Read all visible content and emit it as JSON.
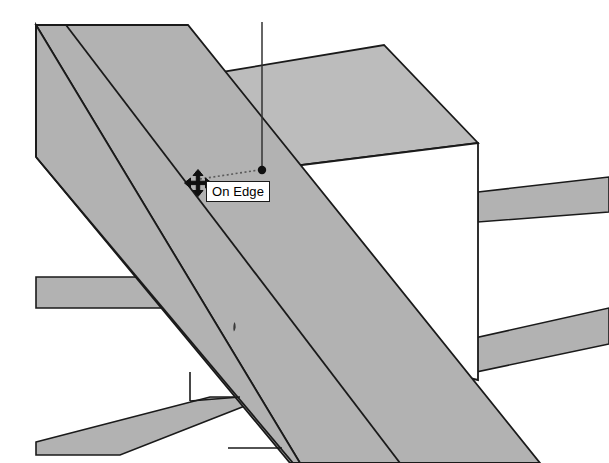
{
  "app": {
    "name": "SketchUp",
    "view_mode": "3D Perspective Viewport",
    "background_color": "#ffffff"
  },
  "viewport": {
    "width": 609,
    "height": 463,
    "face_fill": "#b2b2b2",
    "top_face_fill": "#bcbcbc",
    "edge_color": "#1a1a1a",
    "axis_line_color": "#333333",
    "white_face_fill": "#ffffff"
  },
  "tooltip": {
    "label": "On Edge",
    "inference_type": "edge",
    "background": "#ffffff",
    "border_color": "#1a1a1a",
    "text_color": "#000000",
    "x": 206,
    "y": 181,
    "width": 66,
    "height": 21
  },
  "cursor": {
    "icon": "move-cursor-icon",
    "type": "four-way-move-arrow",
    "x": 198,
    "y": 183,
    "color": "#101010"
  },
  "inference": {
    "dotted_line": {
      "from_x": 200,
      "from_y": 179,
      "to_x": 260,
      "to_y": 170,
      "style": "dotted",
      "color": "#555555"
    },
    "endpoint_dot": {
      "x": 262,
      "y": 170,
      "radius": 4,
      "color": "#101010",
      "name": "endpoint-marker"
    },
    "blue_axis_line": {
      "from_x": 262,
      "from_y": 22,
      "to_x": 262,
      "to_y": 170,
      "color": "#333333",
      "name": "vertical-axis-guide"
    }
  },
  "geometry": {
    "description": "Two parallel diagonal beams crossing a rectangular post, with two horizontal beams on the left and right",
    "elements": [
      {
        "name": "diagonal-beam-main",
        "fill": "#b2b2b2"
      },
      {
        "name": "diagonal-beam-secondary",
        "fill": "#b2b2b2"
      },
      {
        "name": "post-top-face",
        "fill": "#bcbcbc"
      },
      {
        "name": "post-front-face",
        "fill": "#ffffff"
      },
      {
        "name": "beam-left-upper",
        "fill": "#b2b2b2"
      },
      {
        "name": "beam-left-lower",
        "fill": "#b2b2b2"
      },
      {
        "name": "beam-right-upper",
        "fill": "#b2b2b2"
      },
      {
        "name": "beam-right-lower",
        "fill": "#b2b2b2"
      }
    ]
  },
  "artifacts": {
    "speck": {
      "x": 235,
      "y": 328,
      "color": "#3a3a3a",
      "name": "scan-speck"
    }
  }
}
